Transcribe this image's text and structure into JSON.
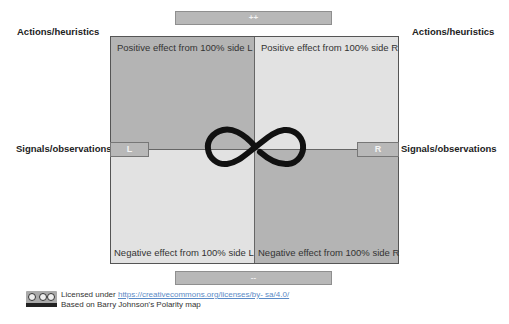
{
  "diagram": {
    "title": "Polarity map",
    "top_bar": {
      "label": "++"
    },
    "bottom_bar": {
      "label": "--"
    },
    "left_labels": {
      "top": "Actions/heuristics",
      "middle": "Signals/observations"
    },
    "right_labels": {
      "top": "Actions/heuristics",
      "middle": "Signals/observations"
    },
    "quadrants": {
      "top_left": {
        "text": "Positive effect from 100% side L",
        "color": "#b4b4b4"
      },
      "top_right": {
        "text": "Positive effect from 100% side R",
        "color": "#e2e2e2"
      },
      "bottom_left": {
        "text": "Negative effect from 100% side L",
        "color": "#e2e2e2"
      },
      "bottom_right": {
        "text": "Negative effect from 100% side R",
        "color": "#b4b4b4"
      }
    },
    "tabs": {
      "left": "L",
      "right": "R"
    },
    "center_icon": "infinity-icon"
  },
  "footer": {
    "license_prefix": "Licensed under ",
    "license_link": "https://creativecommons.org/licenses/by- sa/4.0/",
    "attribution": "Based on Barry Johnson's Polarity map",
    "badge_icon": "cc-by-sa-badge"
  }
}
